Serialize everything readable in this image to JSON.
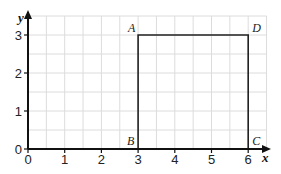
{
  "chart_data": {
    "type": "line",
    "title": "",
    "xlabel": "x",
    "ylabel": "y",
    "xlim": [
      0,
      6.5
    ],
    "ylim": [
      0,
      3.5
    ],
    "grid": true,
    "grid_step": 0.5,
    "x_ticks": [
      "0",
      "1",
      "2",
      "3",
      "4",
      "5",
      "6"
    ],
    "y_ticks": [
      "0",
      "1",
      "2",
      "3"
    ],
    "series": [
      {
        "name": "ABCD",
        "points": [
          {
            "label": "A",
            "x": 3,
            "y": 3
          },
          {
            "label": "D",
            "x": 6,
            "y": 3
          },
          {
            "label": "C",
            "x": 6,
            "y": 0
          },
          {
            "label": "B",
            "x": 3,
            "y": 0
          }
        ]
      }
    ],
    "point_labels": {
      "A": "A",
      "B": "B",
      "C": "C",
      "D": "D"
    }
  },
  "colors": {
    "grid": "#dcdcdc",
    "axis": "#111111",
    "shape": "#222222"
  }
}
